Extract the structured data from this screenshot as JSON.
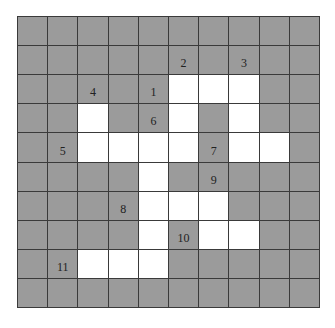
{
  "puzzle": {
    "type": "crossword",
    "rows": 10,
    "cols": 10,
    "colors": {
      "blocked": "#9b9b9b",
      "open": "#ffffff",
      "lines": "#3a3a3a"
    },
    "grid": [
      "##########",
      "##########",
      "#####OOO##",
      "##O##O#O##",
      "##OOOO#OO#",
      "####O#####",
      "####OOO###",
      "####O#OO##",
      "##OOO#####",
      "##########"
    ],
    "labels": [
      {
        "row": 1,
        "col": 5,
        "text": "2"
      },
      {
        "row": 1,
        "col": 7,
        "text": "3"
      },
      {
        "row": 2,
        "col": 2,
        "text": "4"
      },
      {
        "row": 2,
        "col": 4,
        "text": "1"
      },
      {
        "row": 3,
        "col": 4,
        "text": "6"
      },
      {
        "row": 4,
        "col": 1,
        "text": "5"
      },
      {
        "row": 4,
        "col": 6,
        "text": "7"
      },
      {
        "row": 5,
        "col": 6,
        "text": "9"
      },
      {
        "row": 6,
        "col": 3,
        "text": "8"
      },
      {
        "row": 7,
        "col": 5,
        "text": "10"
      },
      {
        "row": 8,
        "col": 1,
        "text": "11"
      }
    ]
  }
}
